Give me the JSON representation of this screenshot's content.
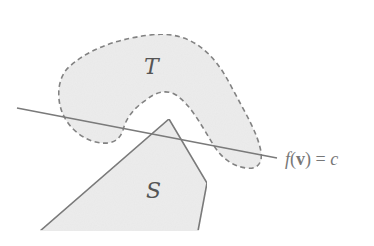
{
  "diagram": {
    "colors": {
      "background": "#ffffff",
      "region_fill": "#ececec",
      "stroke": "#777777",
      "text": "#555555",
      "equation_text": "#777777"
    },
    "shapes": [
      {
        "id": "T",
        "label": "T",
        "type": "blob",
        "outline": "dashed",
        "description": "Boomerang-shaped region with dashed outline"
      },
      {
        "id": "S",
        "label": "S",
        "type": "polygon",
        "outline": "solid",
        "description": "Convex polygon region with solid outline, cut off at bottom"
      }
    ],
    "line": {
      "label_parts": {
        "f": "f",
        "open": "(",
        "v": "v",
        "close": ")",
        "equals": " = ",
        "c": "c"
      },
      "equation": "f(v) = c",
      "description": "Separating hyperplane crossing both regions"
    }
  }
}
